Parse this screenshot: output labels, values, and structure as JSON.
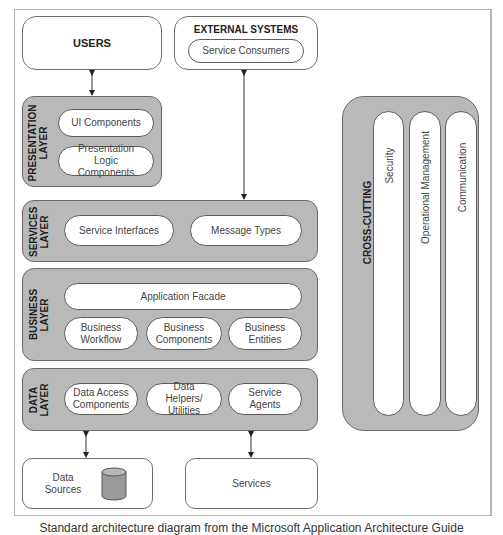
{
  "users": {
    "label": "USERS"
  },
  "external_systems": {
    "title": "EXTERNAL SYSTEMS",
    "items": [
      "Service Consumers"
    ]
  },
  "layers": {
    "presentation": {
      "label_line1": "PRESENTATION",
      "label_line2": "LAYER",
      "items": [
        "UI Components",
        "Presentation Logic Components"
      ]
    },
    "services": {
      "label_line1": "SERVICES",
      "label_line2": "LAYER",
      "items": [
        "Service Interfaces",
        "Message Types"
      ]
    },
    "business": {
      "label_line1": "BUSINESS",
      "label_line2": "LAYER",
      "facade": "Application Facade",
      "items": [
        "Business Workflow",
        "Business Components",
        "Business Entities"
      ]
    },
    "data": {
      "label_line1": "DATA",
      "label_line2": "LAYER",
      "items": [
        "Data Access Components",
        "Data Helpers/ Utilities",
        "Service Agents"
      ]
    }
  },
  "cross_cutting": {
    "title": "CROSS-CUTTING",
    "items": [
      "Security",
      "Operational Management",
      "Communication"
    ]
  },
  "data_sources": {
    "label": "Data Sources",
    "icon": "database-cylinder-icon"
  },
  "services_box": {
    "label": "Services"
  },
  "caption": "Standard architecture diagram from the Microsoft Application Architecture Guide",
  "colors": {
    "layer_fill": "#b9b9b9",
    "border": "#6a6a6a",
    "cylinder": "#9a9a9a"
  }
}
